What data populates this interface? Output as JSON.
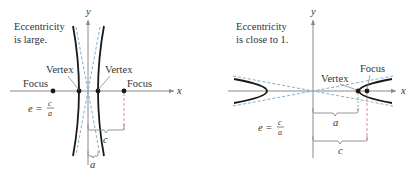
{
  "left_panel": {
    "caption_line1": "Eccentricity",
    "caption_line2": "is large.",
    "axis_x_label": "x",
    "axis_y_label": "y",
    "vertex_left_label": "Vertex",
    "vertex_right_label": "Vertex",
    "focus_left_label": "Focus",
    "focus_right_label": "Focus",
    "formula_lhs": "e =",
    "formula_num": "c",
    "formula_den": "a",
    "brace_c_label": "c",
    "brace_a_label": "a"
  },
  "right_panel": {
    "caption_line1": "Eccentricity",
    "caption_line2": "is close to 1.",
    "axis_x_label": "x",
    "axis_y_label": "y",
    "vertex_label": "Vertex",
    "focus_label": "Focus",
    "formula_lhs": "e =",
    "formula_num": "c",
    "formula_den": "a",
    "brace_a_label": "a",
    "brace_c_label": "c"
  },
  "colors": {
    "curve": "#1a1a1a",
    "axis": "#8a8a8a",
    "asymptote": "#7fb0d0",
    "focus_guide": "#e08a9a",
    "text": "#333333"
  }
}
